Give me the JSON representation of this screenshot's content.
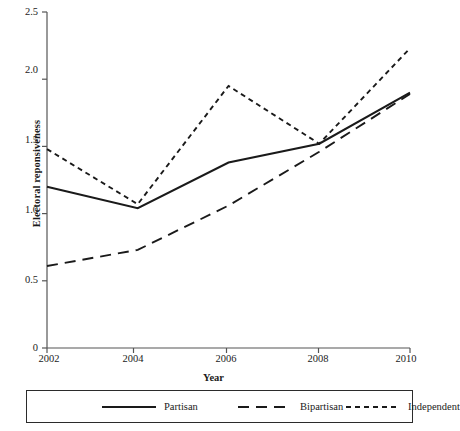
{
  "chart_data": {
    "type": "line",
    "title": "",
    "xlabel": "Year",
    "ylabel": "Electoral reponsiveness",
    "x": [
      2002,
      2004,
      2006,
      2008,
      2010
    ],
    "xticklabels": [
      "2002",
      "2004",
      "2006",
      "2008",
      "2010"
    ],
    "yticks": [
      0,
      0.5,
      1.0,
      1.5,
      2.0,
      2.5
    ],
    "yticklabels": [
      "0",
      "0.5",
      "1.0",
      "1.5",
      "2.0",
      "2.5"
    ],
    "xlim": [
      2002,
      2010
    ],
    "ylim": [
      0,
      2.5
    ],
    "grid": false,
    "legend_position": "below-axes",
    "series": [
      {
        "name": "Partisan",
        "linestyle": "solid",
        "color": "#1a1a1a",
        "values": [
          1.2,
          1.04,
          1.38,
          1.52,
          1.9
        ]
      },
      {
        "name": "Bipartisan",
        "linestyle": "long-dash",
        "color": "#1a1a1a",
        "values": [
          0.61,
          0.73,
          1.06,
          1.46,
          1.89
        ]
      },
      {
        "name": "Independent",
        "linestyle": "short-dash",
        "color": "#1a1a1a",
        "values": [
          1.48,
          1.07,
          1.95,
          1.52,
          2.23
        ]
      }
    ]
  },
  "axes": {
    "ytick_0": "0",
    "ytick_1": "0.5",
    "ytick_2": "1.0",
    "ytick_3": "1.5",
    "ytick_4": "2.0",
    "ytick_5": "2.5",
    "xtick_0": "2002",
    "xtick_1": "2004",
    "xtick_2": "2006",
    "xtick_3": "2008",
    "xtick_4": "2010",
    "xlabel": "Year",
    "ylabel": "Electoral reponsiveness"
  },
  "legend": {
    "entries": [
      {
        "label": "Partisan",
        "style": "solid"
      },
      {
        "label": "Bipartisan",
        "style": "long-dash"
      },
      {
        "label": "Independent",
        "style": "short-dash"
      }
    ]
  },
  "colors": {
    "line": "#1a1a1a",
    "axis": "#555555",
    "legend_border": "#2b2b2b",
    "background": "#ffffff"
  }
}
